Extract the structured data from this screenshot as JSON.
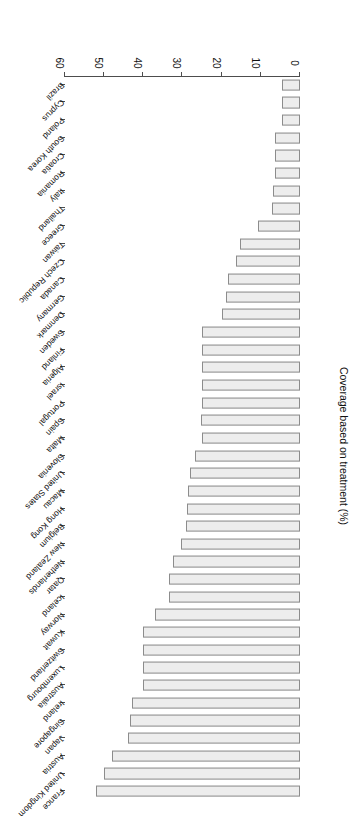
{
  "chart_data": {
    "type": "bar",
    "orientation": "horizontal",
    "title": "",
    "xlabel": "",
    "ylabel": "Coverage based on treatment (%)",
    "ylim": [
      0,
      60
    ],
    "yticks": [
      0,
      10,
      20,
      30,
      40,
      50,
      60
    ],
    "grid": false,
    "legend": null,
    "categories": [
      "France",
      "United Kingdom",
      "Austria",
      "Japan",
      "Singapore",
      "Ireland",
      "Australia",
      "Luxembourg",
      "Switzerland",
      "Kuwait",
      "Norway",
      "Iceland",
      "Qatar",
      "Netherlands",
      "New Zealand",
      "Belgium",
      "Hong Kong",
      "Macau",
      "United States",
      "Slovenia",
      "Malta",
      "Spain",
      "Portugal",
      "Israel",
      "Algeria",
      "Finland",
      "Sweden",
      "Denmark",
      "Germany",
      "Canada",
      "Czech Republic",
      "Taiwan",
      "Greece",
      "Thailand",
      "Italy",
      "Romania",
      "Croatia",
      "South Korea",
      "Poland",
      "Cyprus",
      "Brazil"
    ],
    "values": [
      52.1,
      50.0,
      48.0,
      44.0,
      43.5,
      42.8,
      40.0,
      40.0,
      40.0,
      40.0,
      37.0,
      33.5,
      33.5,
      32.3,
      30.3,
      29.0,
      28.9,
      28.5,
      28.0,
      26.8,
      25.0,
      25.3,
      25.0,
      24.9,
      24.9,
      24.9,
      25.0,
      19.8,
      18.9,
      18.3,
      16.3,
      15.3,
      10.6,
      7.2,
      7.0,
      6.5,
      6.5,
      6.5,
      4.7,
      4.7,
      4.5
    ]
  },
  "axis": {
    "value_axis_label": "Coverage based on treatment (%)",
    "tick_labels": [
      "0",
      "10",
      "20",
      "30",
      "40",
      "50",
      "60"
    ]
  }
}
